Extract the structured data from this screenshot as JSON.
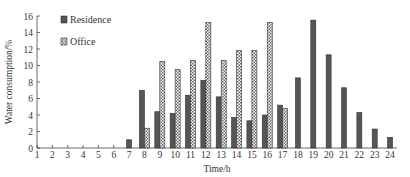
{
  "chart_data": {
    "type": "bar",
    "title": "",
    "xlabel": "Time/h",
    "ylabel": "Water consumption/%",
    "ylim": [
      0,
      16
    ],
    "yticks": [
      0,
      2,
      4,
      6,
      8,
      10,
      12,
      14,
      16
    ],
    "grid": false,
    "legend_position": "upper-left",
    "categories": [
      "1",
      "2",
      "3",
      "4",
      "5",
      "6",
      "7",
      "8",
      "9",
      "10",
      "11",
      "12",
      "13",
      "14",
      "15",
      "16",
      "17",
      "18",
      "19",
      "20",
      "21",
      "22",
      "23",
      "24"
    ],
    "series": [
      {
        "name": "Residence",
        "pattern": "solid-dark",
        "color": "#555555",
        "values": [
          0,
          0,
          0,
          0,
          0,
          0,
          1.0,
          7.0,
          4.4,
          4.2,
          6.4,
          8.2,
          6.2,
          3.7,
          3.3,
          4.0,
          5.2,
          8.5,
          15.5,
          11.3,
          7.3,
          4.3,
          2.3,
          1.3
        ]
      },
      {
        "name": "Office",
        "pattern": "crosshatch",
        "color": "#888888",
        "values": [
          0,
          0,
          0,
          0,
          0,
          0,
          0,
          2.4,
          10.5,
          9.5,
          10.6,
          15.2,
          10.6,
          11.8,
          11.8,
          15.2,
          4.8,
          0,
          0,
          0,
          0,
          0,
          0,
          0
        ]
      }
    ]
  },
  "legend": {
    "items": [
      {
        "label": "Residence"
      },
      {
        "label": "Office"
      }
    ]
  },
  "axes": {
    "x_title": "Time/h",
    "y_title": "Water consumption/%"
  }
}
